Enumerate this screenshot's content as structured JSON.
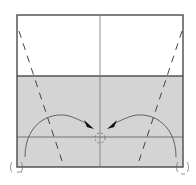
{
  "diagram": {
    "type": "origami-fold-step",
    "paper": {
      "x": 17,
      "y": 15,
      "width": 166,
      "height": 152,
      "edge_color": "#555555",
      "front_color": "#ffffff",
      "back_color": "#d4d4d4",
      "shaded_region_top": 76
    },
    "creases": {
      "center_vertical_x": 100,
      "horizontal_y": 137,
      "crease_color": "#666666"
    },
    "valley_folds": [
      {
        "x1": 19,
        "y1": 30,
        "x2": 63,
        "y2": 167
      },
      {
        "x1": 182,
        "y1": 30,
        "x2": 137,
        "y2": 167
      }
    ],
    "arrows": [
      {
        "direction": "left-corner-to-center"
      },
      {
        "direction": "right-corner-to-center"
      }
    ],
    "markers": {
      "target_point": {
        "x": 100,
        "y": 138
      },
      "left_corner": {
        "x": 17,
        "y": 167
      },
      "right_corner": {
        "x": 183,
        "y": 167
      }
    }
  }
}
